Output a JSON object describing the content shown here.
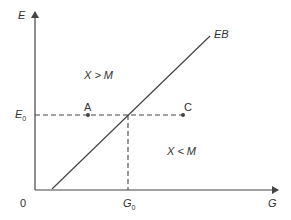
{
  "diagram": {
    "axes": {
      "y_label": "E",
      "x_label": "G",
      "origin_label": "0"
    },
    "curve": {
      "label": "EB"
    },
    "equilibrium": {
      "e_label": "E",
      "e_sub": "0",
      "g_label": "G",
      "g_sub": "0"
    },
    "points": [
      {
        "label": "A"
      },
      {
        "label": "C"
      }
    ],
    "regions": {
      "upper": "X > M",
      "lower": "X < M"
    },
    "colors": {
      "line": "#444444",
      "text": "#333333",
      "background": "#ffffff"
    }
  }
}
